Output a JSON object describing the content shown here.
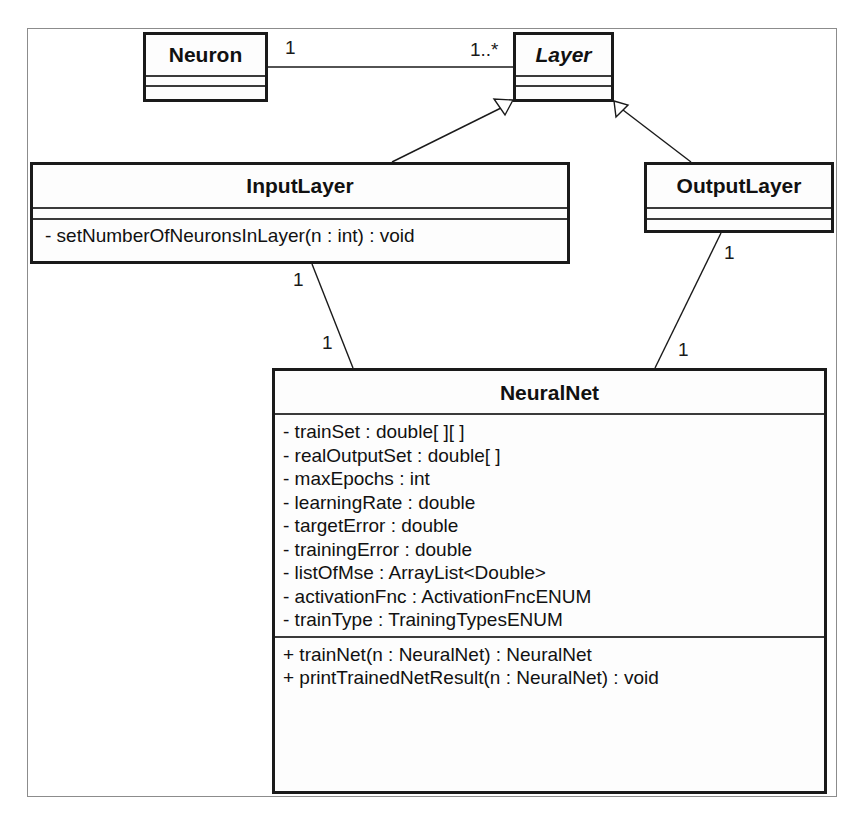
{
  "diagram": {
    "type": "UML class diagram",
    "classes": {
      "neuron": {
        "name": "Neuron",
        "abstract": false,
        "attributes": [],
        "operations": []
      },
      "layer": {
        "name": "Layer",
        "abstract": true,
        "attributes": [],
        "operations": []
      },
      "input_layer": {
        "name": "InputLayer",
        "abstract": false,
        "attributes": [],
        "operations": [
          "- setNumberOfNeuronsInLayer(n : int) : void"
        ]
      },
      "output_layer": {
        "name": "OutputLayer",
        "abstract": false,
        "attributes": [],
        "operations": []
      },
      "neural_net": {
        "name": "NeuralNet",
        "abstract": false,
        "attributes": [
          "- trainSet : double[ ][ ]",
          "- realOutputSet : double[ ]",
          "- maxEpochs : int",
          "- learningRate : double",
          "- targetError : double",
          "- trainingError : double",
          "- listOfMse : ArrayList<Double>",
          "- activationFnc : ActivationFncENUM",
          "- trainType : TrainingTypesENUM"
        ],
        "operations": [
          "+ trainNet(n : NeuralNet) : NeuralNet",
          "+ printTrainedNetResult(n : NeuralNet) : void"
        ]
      }
    },
    "relationships": {
      "neuron_layer": {
        "kind": "association",
        "from": "Neuron",
        "to": "Layer",
        "from_multiplicity": "1",
        "to_multiplicity": "1..*"
      },
      "inputlayer_layer": {
        "kind": "generalization",
        "from": "InputLayer",
        "to": "Layer"
      },
      "outputlayer_layer": {
        "kind": "generalization",
        "from": "OutputLayer",
        "to": "Layer"
      },
      "inputlayer_neuralnet": {
        "kind": "association",
        "from": "InputLayer",
        "to": "NeuralNet",
        "from_multiplicity": "1",
        "to_multiplicity": "1"
      },
      "outputlayer_neuralnet": {
        "kind": "association",
        "from": "OutputLayer",
        "to": "NeuralNet",
        "from_multiplicity": "1",
        "to_multiplicity": "1"
      }
    }
  },
  "colors": {
    "line": "#1a1a1a",
    "frame": "#8c8c8c",
    "background": "#ffffff"
  }
}
